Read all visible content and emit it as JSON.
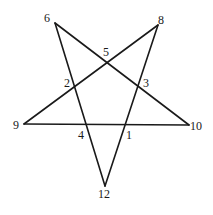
{
  "diagram": {
    "type": "pentagram",
    "outer_vertices": [
      {
        "id": "6",
        "label": "6",
        "x": 55,
        "y": 23,
        "lx": 44,
        "ly": 22
      },
      {
        "id": "8",
        "label": "8",
        "x": 158,
        "y": 25,
        "lx": 158,
        "ly": 24
      },
      {
        "id": "9",
        "label": "9",
        "x": 24,
        "y": 124,
        "lx": 13,
        "ly": 129
      },
      {
        "id": "10",
        "label": "10",
        "x": 189,
        "y": 125,
        "lx": 190,
        "ly": 130
      },
      {
        "id": "12",
        "label": "12",
        "x": 105,
        "y": 186,
        "lx": 98,
        "ly": 198
      }
    ],
    "inner_points": [
      {
        "id": "5",
        "label": "5",
        "lx": 103,
        "ly": 56
      },
      {
        "id": "2",
        "label": "2",
        "lx": 64,
        "ly": 87
      },
      {
        "id": "3",
        "label": "3",
        "lx": 143,
        "ly": 87
      },
      {
        "id": "4",
        "label": "4",
        "lx": 78,
        "ly": 139
      },
      {
        "id": "1",
        "label": "1",
        "lx": 126,
        "ly": 139
      }
    ],
    "edges": [
      {
        "from": "6",
        "to": "10"
      },
      {
        "from": "6",
        "to": "12"
      },
      {
        "from": "8",
        "to": "9"
      },
      {
        "from": "8",
        "to": "12"
      },
      {
        "from": "9",
        "to": "10"
      }
    ]
  }
}
